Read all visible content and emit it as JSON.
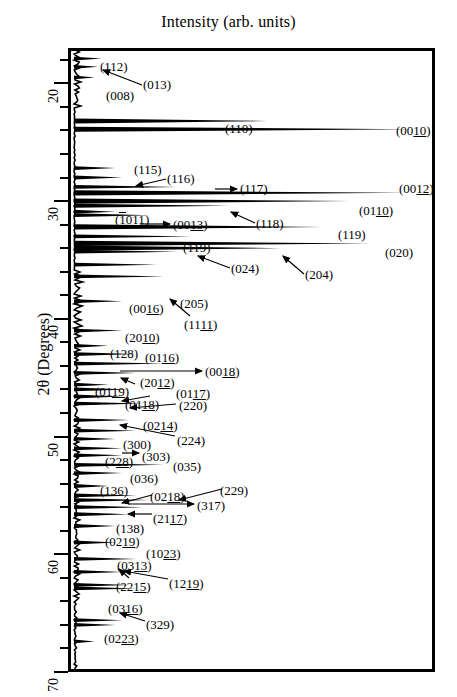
{
  "chart_data": {
    "type": "line",
    "title": "Intensity (arb. units)",
    "xlabel": "Intensity (arb. units)",
    "ylabel": "2θ (Degrees)",
    "orientation": "horizontal-intensity-vertical-angle",
    "ylim": [
      17.0,
      70.0
    ],
    "y_ticks_major": [
      20,
      30,
      40,
      50,
      60,
      70
    ],
    "y_tick_minor_step": 2,
    "grid": false,
    "legend": null,
    "axis_note": "2-theta increases downward; intensity increases to the right",
    "peaks": [
      {
        "label": "(112)",
        "two_theta": 17.9,
        "intensity": 0.08
      },
      {
        "label": "(013)",
        "two_theta": 18.6,
        "intensity": 0.07
      },
      {
        "label": "(008)",
        "two_theta": 19.5,
        "intensity": 0.06
      },
      {
        "label": "(110)",
        "two_theta": 23.2,
        "intensity": 0.56
      },
      {
        "label": "(0010)",
        "two_theta": 23.9,
        "intensity": 0.98
      },
      {
        "label": "(115)",
        "two_theta": 27.2,
        "intensity": 0.12
      },
      {
        "label": "(116)",
        "two_theta": 28.0,
        "intensity": 0.14
      },
      {
        "label": "(117)",
        "two_theta": 28.8,
        "intensity": 0.3
      },
      {
        "label": "(0012)",
        "two_theta": 29.3,
        "intensity": 0.96
      },
      {
        "label": "(0110)",
        "two_theta": 30.0,
        "intensity": 0.8
      },
      {
        "label": "(1011)",
        "two_theta": 30.9,
        "intensity": 0.12
      },
      {
        "label": "(0013)",
        "two_theta": 31.2,
        "intensity": 0.22
      },
      {
        "label": "(118)",
        "two_theta": 30.4,
        "intensity": 0.45
      },
      {
        "label": "(119)",
        "two_theta": 32.2,
        "intensity": 0.72
      },
      {
        "label": "(119)",
        "two_theta": 33.0,
        "intensity": 0.34
      },
      {
        "label": "(020)",
        "two_theta": 33.6,
        "intensity": 0.86
      },
      {
        "label": "(024)",
        "two_theta": 34.3,
        "intensity": 0.3
      },
      {
        "label": "(204)",
        "two_theta": 34.0,
        "intensity": 0.6
      },
      {
        "label": "(205)",
        "two_theta": 35.4,
        "intensity": 0.24
      },
      {
        "label": "(1111)",
        "two_theta": 36.4,
        "intensity": 0.26
      },
      {
        "label": "(0016)",
        "two_theta": 38.5,
        "intensity": 0.14
      },
      {
        "label": "(2010)",
        "two_theta": 41.0,
        "intensity": 0.14
      },
      {
        "label": "(128)",
        "two_theta": 42.3,
        "intensity": 0.1
      },
      {
        "label": "(0116)",
        "two_theta": 43.0,
        "intensity": 0.18
      },
      {
        "label": "(0018)",
        "two_theta": 43.8,
        "intensity": 0.26
      },
      {
        "label": "(2012)",
        "two_theta": 44.6,
        "intensity": 0.18
      },
      {
        "label": "(0119)",
        "two_theta": 45.6,
        "intensity": 0.1
      },
      {
        "label": "(0117)",
        "two_theta": 46.0,
        "intensity": 0.16
      },
      {
        "label": "(0118)",
        "two_theta": 46.6,
        "intensity": 0.14
      },
      {
        "label": "(220)",
        "two_theta": 47.2,
        "intensity": 0.2
      },
      {
        "label": "(0214)",
        "two_theta": 48.6,
        "intensity": 0.16
      },
      {
        "label": "(224)",
        "two_theta": 49.5,
        "intensity": 0.18
      },
      {
        "label": "(300)",
        "two_theta": 50.2,
        "intensity": 0.12
      },
      {
        "label": "(303)",
        "two_theta": 51.0,
        "intensity": 0.14
      },
      {
        "label": "(228)",
        "two_theta": 51.6,
        "intensity": 0.14
      },
      {
        "label": "(035)",
        "two_theta": 52.4,
        "intensity": 0.26
      },
      {
        "label": "(036)",
        "two_theta": 53.1,
        "intensity": 0.14
      },
      {
        "label": "(136)",
        "two_theta": 54.2,
        "intensity": 0.1
      },
      {
        "label": "(0218)",
        "two_theta": 55.0,
        "intensity": 0.18
      },
      {
        "label": "(229)",
        "two_theta": 55.4,
        "intensity": 0.22
      },
      {
        "label": "(317)",
        "two_theta": 56.0,
        "intensity": 0.2
      },
      {
        "label": "(2117)",
        "two_theta": 56.6,
        "intensity": 0.16
      },
      {
        "label": "(138)",
        "two_theta": 57.6,
        "intensity": 0.12
      },
      {
        "label": "(0219)",
        "two_theta": 59.0,
        "intensity": 0.12
      },
      {
        "label": "(1023)",
        "two_theta": 60.4,
        "intensity": 0.18
      },
      {
        "label": "(0313)",
        "two_theta": 61.5,
        "intensity": 0.14
      },
      {
        "label": "(2215)",
        "two_theta": 62.6,
        "intensity": 0.16
      },
      {
        "label": "(1219)",
        "two_theta": 62.9,
        "intensity": 0.18
      },
      {
        "label": "(0316)",
        "two_theta": 65.6,
        "intensity": 0.14
      },
      {
        "label": "(329)",
        "two_theta": 66.0,
        "intensity": 0.12
      },
      {
        "label": "(0223)",
        "two_theta": 67.4,
        "intensity": 0.06
      }
    ]
  },
  "axis": {
    "tick_labels": [
      "20",
      "30",
      "40",
      "50",
      "60",
      "70"
    ],
    "y_title": "2θ (Degrees)"
  },
  "annotations": [
    {
      "id": "a01",
      "text": "(112)",
      "under": "",
      "overbar": ""
    },
    {
      "id": "a02",
      "text": "(013)",
      "under": "",
      "overbar": ""
    },
    {
      "id": "a03",
      "text": "(008)",
      "under": "",
      "overbar": ""
    },
    {
      "id": "a04",
      "text": "(110)",
      "under": "",
      "overbar": ""
    },
    {
      "id": "a05",
      "text": "(0010)",
      "under": "10",
      "overbar": ""
    },
    {
      "id": "a06",
      "text": "(115)",
      "under": "",
      "overbar": ""
    },
    {
      "id": "a07",
      "text": "(116)",
      "under": "",
      "overbar": ""
    },
    {
      "id": "a08",
      "text": "(117)",
      "under": "",
      "overbar": ""
    },
    {
      "id": "a09",
      "text": "(0012)",
      "under": "12",
      "overbar": ""
    },
    {
      "id": "a10",
      "text": "(0110)",
      "under": "10",
      "overbar": ""
    },
    {
      "id": "a11",
      "text": "(1011)",
      "under": "11",
      "overbar": "1"
    },
    {
      "id": "a12",
      "text": "(0013)",
      "under": "13",
      "overbar": ""
    },
    {
      "id": "a13",
      "text": "(118)",
      "under": "",
      "overbar": ""
    },
    {
      "id": "a14",
      "text": "(119)",
      "under": "",
      "overbar": ""
    },
    {
      "id": "a15",
      "text": "(119)",
      "under": "",
      "overbar": ""
    },
    {
      "id": "a16",
      "text": "(020)",
      "under": "",
      "overbar": ""
    },
    {
      "id": "a17",
      "text": "(024)",
      "under": "",
      "overbar": ""
    },
    {
      "id": "a18",
      "text": "(204)",
      "under": "",
      "overbar": ""
    },
    {
      "id": "a19",
      "text": "(205)",
      "under": "",
      "overbar": ""
    },
    {
      "id": "a20",
      "text": "(1111)",
      "under": "11",
      "overbar": ""
    },
    {
      "id": "a21",
      "text": "(0016)",
      "under": "16",
      "overbar": ""
    },
    {
      "id": "a22",
      "text": "(2010)",
      "under": "10",
      "overbar": ""
    },
    {
      "id": "a23",
      "text": "(128)",
      "under": "",
      "overbar": ""
    },
    {
      "id": "a24",
      "text": "(0116)",
      "under": "16",
      "overbar": ""
    },
    {
      "id": "a25",
      "text": "(0018)",
      "under": "18",
      "overbar": ""
    },
    {
      "id": "a26",
      "text": "(2012)",
      "under": "12",
      "overbar": ""
    },
    {
      "id": "a27",
      "text": "(0119)",
      "under": "19",
      "overbar": ""
    },
    {
      "id": "a28",
      "text": "(0117)",
      "under": "17",
      "overbar": ""
    },
    {
      "id": "a29",
      "text": "(0118)",
      "under": "18",
      "overbar": ""
    },
    {
      "id": "a30",
      "text": "(220)",
      "under": "",
      "overbar": ""
    },
    {
      "id": "a31",
      "text": "(0214)",
      "under": "14",
      "overbar": ""
    },
    {
      "id": "a32",
      "text": "(224)",
      "under": "",
      "overbar": ""
    },
    {
      "id": "a33",
      "text": "(300)",
      "under": "",
      "overbar": ""
    },
    {
      "id": "a34",
      "text": "(303)",
      "under": "",
      "overbar": ""
    },
    {
      "id": "a35",
      "text": "(228)",
      "under": "28",
      "overbar": ""
    },
    {
      "id": "a36",
      "text": "(035)",
      "under": "",
      "overbar": ""
    },
    {
      "id": "a37",
      "text": "(036)",
      "under": "",
      "overbar": ""
    },
    {
      "id": "a38",
      "text": "(136)",
      "under": "",
      "overbar": ""
    },
    {
      "id": "a39",
      "text": "(0218)",
      "under": "18",
      "overbar": ""
    },
    {
      "id": "a40",
      "text": "(229)",
      "under": "",
      "overbar": ""
    },
    {
      "id": "a41",
      "text": "(317)",
      "under": "",
      "overbar": ""
    },
    {
      "id": "a42",
      "text": "(2117)",
      "under": "17",
      "overbar": ""
    },
    {
      "id": "a43",
      "text": "(138)",
      "under": "",
      "overbar": ""
    },
    {
      "id": "a44",
      "text": "(0219)",
      "under": "19",
      "overbar": ""
    },
    {
      "id": "a45",
      "text": "(1023)",
      "under": "23",
      "overbar": ""
    },
    {
      "id": "a46",
      "text": "(0313)",
      "under": "13",
      "overbar": ""
    },
    {
      "id": "a47",
      "text": "(2215)",
      "under": "15",
      "overbar": ""
    },
    {
      "id": "a48",
      "text": "(1219)",
      "under": "19",
      "overbar": ""
    },
    {
      "id": "a49",
      "text": "(0316)",
      "under": "16",
      "overbar": ""
    },
    {
      "id": "a50",
      "text": "(329)",
      "under": "",
      "overbar": ""
    },
    {
      "id": "a51",
      "text": "(0223)",
      "under": "23",
      "overbar": ""
    }
  ]
}
